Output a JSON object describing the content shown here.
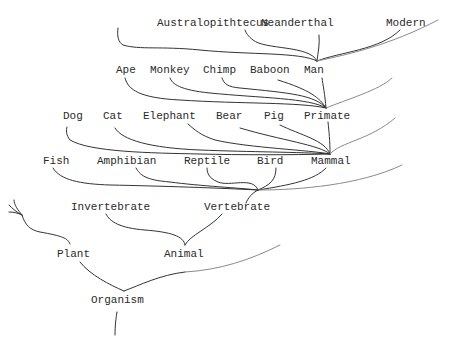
{
  "diagram": {
    "title": "",
    "type": "tree-of-life",
    "nodes": [
      {
        "id": "australopithecus",
        "label": "Australopithtecus",
        "x": 157,
        "y": 26
      },
      {
        "id": "neanderthal",
        "label": "Neanderthal",
        "x": 261,
        "y": 26
      },
      {
        "id": "modern",
        "label": "Modern",
        "x": 386,
        "y": 26
      },
      {
        "id": "ape",
        "label": "Ape",
        "x": 116,
        "y": 73
      },
      {
        "id": "monkey",
        "label": "Monkey",
        "x": 150,
        "y": 73
      },
      {
        "id": "chimp",
        "label": "Chimp",
        "x": 203,
        "y": 73
      },
      {
        "id": "baboon",
        "label": "Baboon",
        "x": 250,
        "y": 73
      },
      {
        "id": "man",
        "label": "Man",
        "x": 304,
        "y": 73
      },
      {
        "id": "dog",
        "label": "Dog",
        "x": 63,
        "y": 119
      },
      {
        "id": "cat",
        "label": "Cat",
        "x": 103,
        "y": 119
      },
      {
        "id": "elephant",
        "label": "Elephant",
        "x": 143,
        "y": 119
      },
      {
        "id": "bear",
        "label": "Bear",
        "x": 216,
        "y": 119
      },
      {
        "id": "pig",
        "label": "Pig",
        "x": 264,
        "y": 119
      },
      {
        "id": "primate",
        "label": "Primate",
        "x": 304,
        "y": 119
      },
      {
        "id": "fish",
        "label": "Fish",
        "x": 43,
        "y": 164
      },
      {
        "id": "amphibian",
        "label": "Amphibian",
        "x": 97,
        "y": 164
      },
      {
        "id": "reptile",
        "label": "Reptile",
        "x": 184,
        "y": 164
      },
      {
        "id": "bird",
        "label": "Bird",
        "x": 257,
        "y": 164
      },
      {
        "id": "mammal",
        "label": "Mammal",
        "x": 311,
        "y": 164
      },
      {
        "id": "invertebrate",
        "label": "Invertebrate",
        "x": 71,
        "y": 210
      },
      {
        "id": "vertebrate",
        "label": "Vertebrate",
        "x": 204,
        "y": 210
      },
      {
        "id": "plant",
        "label": "Plant",
        "x": 57,
        "y": 257
      },
      {
        "id": "animal",
        "label": "Animal",
        "x": 164,
        "y": 257
      },
      {
        "id": "organism",
        "label": "Organism",
        "x": 91,
        "y": 303
      }
    ],
    "edges": [
      {
        "from": "man",
        "to": "australopithecus",
        "d": "M 317 61 C 310 45 265 50 253 40 C 248 36 246 33 245 30"
      },
      {
        "from": "man",
        "to": "neanderthal",
        "d": "M 317 61 C 318 52 320 44 319 35"
      },
      {
        "from": "man",
        "to": "modern",
        "d": "M 317 61 C 340 52 380 50 400 30"
      },
      {
        "from": "man",
        "to": "unlabeled-upper-left",
        "d": "M 317 61 C 300 52 250 55 200 50 C 160 46 140 50 123 45 C 118 42 117 36 118 28"
      },
      {
        "from": "man",
        "to": "unlabeled-upper-right",
        "d": "M 317 61 C 350 54 390 45 438 20",
        "faint": true
      },
      {
        "from": "primate",
        "to": "man",
        "d": "M 326 108 C 325 95 323 85 322 78"
      },
      {
        "from": "primate",
        "to": "baboon",
        "d": "M 326 108 C 320 98 310 90 278 80"
      },
      {
        "from": "primate",
        "to": "chimp",
        "d": "M 326 108 C 315 95 290 93 240 88 C 228 87 224 84 222 78"
      },
      {
        "from": "primate",
        "to": "monkey",
        "d": "M 326 108 C 310 98 260 98 210 93 C 180 90 172 84 170 78"
      },
      {
        "from": "primate",
        "to": "ape",
        "d": "M 326 108 C 300 102 240 104 180 100 C 140 98 128 90 125 78"
      },
      {
        "from": "primate",
        "to": "unlabeled-right",
        "d": "M 326 108 C 345 100 380 90 392 78",
        "faint": true
      },
      {
        "from": "mammal",
        "to": "primate",
        "d": "M 330 154 C 330 140 329 132 328 122"
      },
      {
        "from": "mammal",
        "to": "pig",
        "d": "M 330 154 C 325 140 300 135 280 125"
      },
      {
        "from": "mammal",
        "to": "bear",
        "d": "M 330 154 C 320 145 280 140 240 128"
      },
      {
        "from": "mammal",
        "to": "elephant",
        "d": "M 330 154 C 310 150 250 148 215 140 C 200 135 195 130 188 124"
      },
      {
        "from": "mammal",
        "to": "cat",
        "d": "M 330 154 C 300 152 250 152 200 150 C 150 148 122 140 115 128"
      },
      {
        "from": "mammal",
        "to": "dog",
        "d": "M 330 154 C 290 155 240 155 200 154 C 150 153 90 152 70 140 C 66 135 66 130 67 127"
      },
      {
        "from": "mammal",
        "to": "unlabeled-right",
        "d": "M 330 154 C 340 142 370 140 395 118",
        "faint": true
      },
      {
        "from": "vertebrate",
        "to": "mammal",
        "d": "M 258 190 C 290 185 315 180 326 168"
      },
      {
        "from": "vertebrate",
        "to": "bird",
        "d": "M 258 190 C 270 185 276 180 276 168"
      },
      {
        "from": "vertebrate",
        "to": "reptile",
        "d": "M 258 190 C 253 176 230 187 218 182 C 208 178 207 172 207 168"
      },
      {
        "from": "vertebrate",
        "to": "amphibian",
        "d": "M 258 190 C 240 188 200 186 170 182 C 145 180 140 175 136 168"
      },
      {
        "from": "vertebrate",
        "to": "fish",
        "d": "M 258 190 C 220 188 160 186 110 185 C 80 184 60 180 53 168"
      },
      {
        "from": "vertebrate",
        "to": "unlabeled-right",
        "d": "M 258 190 C 300 190 360 185 402 165",
        "faint": true
      },
      {
        "from": "vertebrate-stem",
        "to": "vertebrate",
        "d": "M 246 203 C 248 198 252 193 258 190"
      },
      {
        "from": "animal",
        "to": "vertebrate",
        "d": "M 185 245 C 190 235 210 228 222 214"
      },
      {
        "from": "animal",
        "to": "invertebrate",
        "d": "M 185 245 C 184 236 170 232 145 230 C 120 228 110 222 106 214"
      },
      {
        "from": "organism",
        "to": "animal",
        "d": "M 124 291 C 140 285 160 275 185 272"
      },
      {
        "from": "organism",
        "to": "unlabeled-right",
        "d": "M 185 272 C 220 270 250 260 280 245",
        "faint": true
      },
      {
        "from": "organism",
        "to": "plant",
        "d": "M 124 291 C 110 285 90 275 80 262"
      },
      {
        "from": "organism-root",
        "to": "organism",
        "d": "M 115 335 C 115 325 116 318 117 312"
      },
      {
        "from": "plant",
        "to": "unlabeled-plant-branch",
        "d": "M 70 244 C 68 238 62 236 40 232 C 30 230 25 225 22 215"
      },
      {
        "from": "plant",
        "to": "unlabeled-plant-branch-2",
        "d": "M 22 215 C 18 210 14 205 14 200"
      },
      {
        "from": "plant",
        "to": "unlabeled-plant-branch-3",
        "d": "M 22 215 C 18 213 14 212 9 212"
      },
      {
        "from": "plant",
        "to": "unlabeled-plant-branch-4",
        "d": "M 22 215 C 16 212 12 208 9 205"
      }
    ]
  }
}
